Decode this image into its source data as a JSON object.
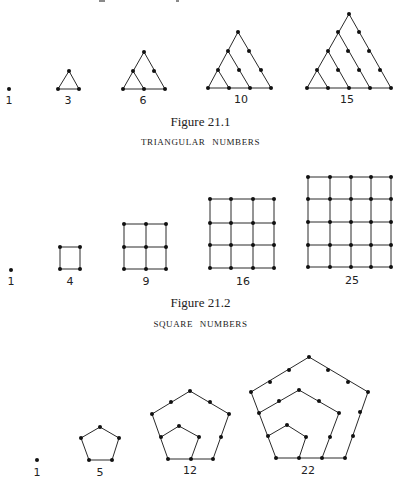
{
  "page": {
    "top_cutoff_marks": [
      {
        "x": 99,
        "w": 6
      },
      {
        "x": 176,
        "w": 3
      }
    ]
  },
  "figures": [
    {
      "id": "triangular",
      "caption": "Figure 21.1",
      "subtitle": "TRIANGULAR NUMBERS",
      "caption_y": 114,
      "subtitle_y": 137,
      "items": [
        {
          "label": "1",
          "label_pos": [
            9,
            104
          ],
          "dots": [
            [
              9,
              89
            ]
          ],
          "edges": []
        },
        {
          "label": "3",
          "label_pos": [
            68,
            104
          ],
          "dots": [
            [
              69,
              71
            ],
            [
              58,
              89
            ],
            [
              79,
              89
            ]
          ],
          "edges": [
            [
              [
                69,
                71
              ],
              [
                58,
                89
              ]
            ],
            [
              [
                69,
                71
              ],
              [
                79,
                89
              ]
            ],
            [
              [
                58,
                89
              ],
              [
                79,
                89
              ]
            ]
          ]
        },
        {
          "label": "6",
          "label_pos": [
            143,
            104
          ],
          "dots": [
            [
              144,
              52
            ],
            [
              133,
              71
            ],
            [
              154,
              71
            ],
            [
              123,
              89
            ],
            [
              144,
              89
            ],
            [
              165,
              89
            ]
          ],
          "edges": [
            [
              [
                144,
                52
              ],
              [
                123,
                89
              ]
            ],
            [
              [
                144,
                52
              ],
              [
                165,
                89
              ]
            ],
            [
              [
                123,
                89
              ],
              [
                165,
                89
              ]
            ],
            [
              [
                133,
                71
              ],
              [
                144,
                89
              ]
            ]
          ]
        },
        {
          "label": "10",
          "label_pos": [
            241,
            103
          ],
          "dots": [
            [
              238,
              32
            ],
            [
              228,
              51
            ],
            [
              249,
              51
            ],
            [
              218,
              70
            ],
            [
              239,
              70
            ],
            [
              261,
              70
            ],
            [
              208,
              88
            ],
            [
              229,
              88
            ],
            [
              250,
              88
            ],
            [
              271,
              88
            ]
          ],
          "edges": [
            [
              [
                238,
                32
              ],
              [
                208,
                88
              ]
            ],
            [
              [
                238,
                32
              ],
              [
                271,
                88
              ]
            ],
            [
              [
                208,
                88
              ],
              [
                271,
                88
              ]
            ],
            [
              [
                228,
                51
              ],
              [
                250,
                88
              ]
            ],
            [
              [
                218,
                70
              ],
              [
                229,
                88
              ]
            ]
          ]
        },
        {
          "label": "15",
          "label_pos": [
            347,
            103
          ],
          "dots": [
            [
              349,
              14
            ],
            [
              338,
              32
            ],
            [
              359,
              32
            ],
            [
              328,
              51
            ],
            [
              348,
              51
            ],
            [
              369,
              51
            ],
            [
              317,
              70
            ],
            [
              338,
              70
            ],
            [
              359,
              70
            ],
            [
              380,
              70
            ],
            [
              307,
              88
            ],
            [
              328,
              88
            ],
            [
              349,
              88
            ],
            [
              370,
              88
            ],
            [
              391,
              88
            ]
          ],
          "edges": [
            [
              [
                349,
                14
              ],
              [
                307,
                88
              ]
            ],
            [
              [
                349,
                14
              ],
              [
                391,
                88
              ]
            ],
            [
              [
                307,
                88
              ],
              [
                391,
                88
              ]
            ],
            [
              [
                338,
                32
              ],
              [
                370,
                88
              ]
            ],
            [
              [
                328,
                51
              ],
              [
                349,
                88
              ]
            ],
            [
              [
                317,
                70
              ],
              [
                328,
                88
              ]
            ]
          ]
        }
      ]
    },
    {
      "id": "square",
      "caption": "Figure 21.2",
      "subtitle": "SQUARE NUMBERS",
      "caption_y": 295,
      "subtitle_y": 319,
      "items": [
        {
          "label": "1",
          "label_pos": [
            11,
            285
          ],
          "grid": {
            "xs": [
              11
            ],
            "ys": [
              270
            ]
          }
        },
        {
          "label": "4",
          "label_pos": [
            70,
            285
          ],
          "grid": {
            "xs": [
              60,
              80
            ],
            "ys": [
              247,
              269
            ]
          }
        },
        {
          "label": "9",
          "label_pos": [
            146,
            285
          ],
          "grid": {
            "xs": [
              124,
              146,
              166
            ],
            "ys": [
              224,
              247,
              269
            ]
          }
        },
        {
          "label": "16",
          "label_pos": [
            243,
            285
          ],
          "grid": {
            "xs": [
              210,
              231,
              253,
              274
            ],
            "ys": [
              199,
              223,
              245,
              268
            ]
          }
        },
        {
          "label": "25",
          "label_pos": [
            352,
            284
          ],
          "grid": {
            "xs": [
              308,
              330,
              351,
              371,
              391
            ],
            "ys": [
              177,
              199,
              222,
              245,
              267
            ]
          }
        }
      ]
    },
    {
      "id": "pentagonal",
      "items": [
        {
          "label": "1",
          "label_pos": [
            37,
            476
          ],
          "dots": [
            [
              37,
              460
            ]
          ],
          "polylines": []
        },
        {
          "label": "5",
          "label_pos": [
            100,
            476
          ],
          "dots": [
            [
              100,
              427
            ],
            [
              81,
              438
            ],
            [
              119,
              438
            ],
            [
              89,
              460
            ],
            [
              112,
              460
            ]
          ],
          "polylines": [
            [
              [
                89,
                460
              ],
              [
                81,
                438
              ],
              [
                100,
                427
              ],
              [
                119,
                438
              ],
              [
                112,
                460
              ],
              [
                89,
                460
              ]
            ]
          ]
        },
        {
          "label": "12",
          "label_pos": [
            190,
            474
          ],
          "dots": [
            [
              190,
              391
            ],
            [
              171,
              402
            ],
            [
              210,
              402
            ],
            [
              152,
              414
            ],
            [
              229,
              414
            ],
            [
              161,
              437
            ],
            [
              221,
              437
            ],
            [
              168,
              459
            ],
            [
              191,
              459
            ],
            [
              213,
              459
            ],
            [
              179,
              426
            ],
            [
              199,
              437
            ]
          ],
          "polylines": [
            [
              [
                168,
                459
              ],
              [
                152,
                414
              ],
              [
                190,
                391
              ],
              [
                229,
                414
              ],
              [
                213,
                459
              ],
              [
                168,
                459
              ]
            ],
            [
              [
                161,
                437
              ],
              [
                179,
                426
              ],
              [
                199,
                437
              ],
              [
                191,
                459
              ]
            ]
          ]
        },
        {
          "label": "22",
          "label_pos": [
            308,
            474
          ],
          "dots": [
            [
              309,
              357
            ],
            [
              289,
              370
            ],
            [
              270,
              382
            ],
            [
              251,
              392
            ],
            [
              328,
              370
            ],
            [
              348,
              382
            ],
            [
              368,
              392
            ],
            [
              259,
              413
            ],
            [
              268,
              436
            ],
            [
              276,
              458
            ],
            [
              360,
              412
            ],
            [
              353,
              436
            ],
            [
              345,
              458
            ],
            [
              299,
              458
            ],
            [
              322,
              458
            ],
            [
              299,
              390
            ],
            [
              279,
              401
            ],
            [
              319,
              401
            ],
            [
              339,
              413
            ],
            [
              330,
              437
            ],
            [
              287,
              425
            ],
            [
              306,
              437
            ]
          ],
          "polylines": [
            [
              [
                276,
                458
              ],
              [
                251,
                392
              ],
              [
                309,
                357
              ],
              [
                368,
                392
              ],
              [
                345,
                458
              ],
              [
                276,
                458
              ]
            ],
            [
              [
                259,
                413
              ],
              [
                299,
                390
              ],
              [
                339,
                413
              ],
              [
                322,
                458
              ]
            ],
            [
              [
                268,
                436
              ],
              [
                287,
                425
              ],
              [
                306,
                437
              ],
              [
                299,
                458
              ]
            ]
          ]
        }
      ]
    }
  ]
}
